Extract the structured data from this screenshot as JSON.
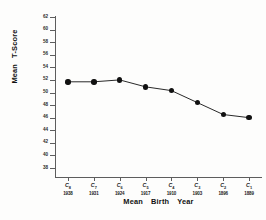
{
  "chart_data": {
    "type": "line",
    "title": "",
    "xlabel": "Mean Birth Year",
    "ylabel": "Mean T-Score",
    "categories": [
      "C8",
      "C7",
      "C6",
      "C5",
      "C4",
      "C3",
      "C2",
      "C1"
    ],
    "x_tick_labels": [
      "1938",
      "1931",
      "1924",
      "1917",
      "1910",
      "1903",
      "1896",
      "1889"
    ],
    "cohort_labels": [
      {
        "base": "C",
        "sub": "8"
      },
      {
        "base": "C",
        "sub": "7"
      },
      {
        "base": "C",
        "sub": "6"
      },
      {
        "base": "C",
        "sub": "5"
      },
      {
        "base": "C",
        "sub": "4"
      },
      {
        "base": "C",
        "sub": "3"
      },
      {
        "base": "C",
        "sub": "2"
      },
      {
        "base": "C",
        "sub": "1"
      }
    ],
    "values": [
      51.7,
      51.7,
      52.0,
      50.9,
      50.3,
      48.4,
      46.5,
      46.0
    ],
    "ylim": [
      38,
      62
    ],
    "y_tick_labels": [
      "62",
      "60",
      "58",
      "56",
      "54",
      "52",
      "50",
      "48",
      "46",
      "44",
      "42",
      "40",
      "38"
    ],
    "y_ticks": [
      62,
      60,
      58,
      56,
      54,
      52,
      50,
      48,
      46,
      44,
      42,
      40,
      38
    ],
    "ystep": 2,
    "grid": false,
    "legend": "none",
    "marker": "filled-circle",
    "line_color": "#111111",
    "marker_color": "#111111",
    "axis_color": "#5d5d5d",
    "background": "#fdfdfc",
    "xlabel_words": [
      "Mean",
      "Birth",
      "Year"
    ],
    "ylabel_words": [
      "Mean",
      "T-Score"
    ]
  }
}
